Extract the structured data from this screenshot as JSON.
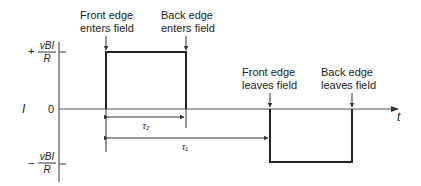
{
  "diagram": {
    "y_axis_label": "I",
    "x_axis_label": "t",
    "levels": {
      "positive": {
        "sign": "+",
        "numerator": "vBI",
        "denominator": "R"
      },
      "zero": "0",
      "negative": {
        "sign": "−",
        "numerator": "vBI",
        "denominator": "R"
      }
    },
    "annotations": [
      {
        "line1": "Front edge",
        "line2": "enters field"
      },
      {
        "line1": "Back edge",
        "line2": "enters field"
      },
      {
        "line1": "Front edge",
        "line2": "leaves field"
      },
      {
        "line1": "Back edge",
        "line2": "leaves field"
      }
    ],
    "intervals": {
      "tau2": "τ₂",
      "tau1": "τ₁"
    }
  }
}
